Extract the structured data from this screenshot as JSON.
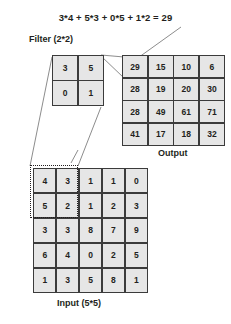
{
  "title": {
    "formula": "3*4 + 5*3 + 0*5 + 1*2 = 29"
  },
  "labels": {
    "filter": "Filter (2*2)",
    "output": "Output",
    "input": "Input (5*5)"
  },
  "filter": {
    "rows": 2,
    "cols": 2,
    "values": [
      [
        3,
        5
      ],
      [
        0,
        1
      ]
    ]
  },
  "output": {
    "rows": 4,
    "cols": 4,
    "values": [
      [
        29,
        15,
        10,
        6
      ],
      [
        28,
        19,
        20,
        30
      ],
      [
        28,
        49,
        61,
        71
      ],
      [
        41,
        17,
        18,
        32
      ]
    ]
  },
  "input": {
    "rows": 5,
    "cols": 5,
    "values": [
      [
        4,
        3,
        1,
        1,
        0
      ],
      [
        5,
        2,
        1,
        2,
        3
      ],
      [
        3,
        3,
        8,
        7,
        9
      ],
      [
        6,
        4,
        0,
        2,
        5
      ],
      [
        1,
        3,
        5,
        8,
        1
      ]
    ]
  },
  "selection": {
    "label": "receptive-field",
    "start_row": 0,
    "start_col": 0,
    "rows": 2,
    "cols": 2
  },
  "colors": {
    "cell_fill": "#e6e6e6",
    "border": "#3b3b3b",
    "text": "#231f20",
    "connector": "#6e6e6e",
    "background": "#ffffff"
  }
}
